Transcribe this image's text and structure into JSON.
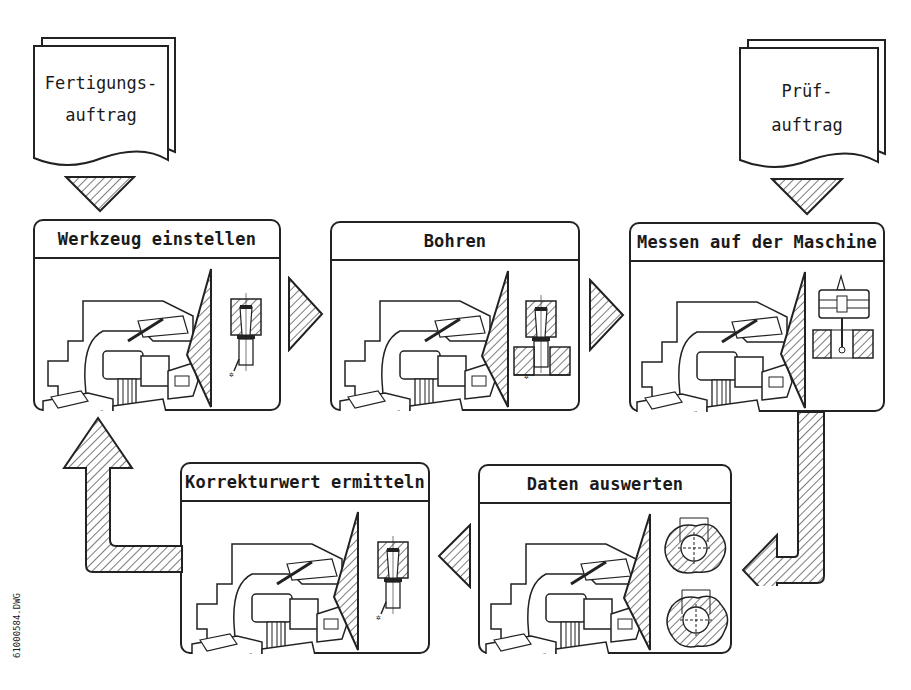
{
  "documents": [
    {
      "id": "fertigungsauftrag",
      "line1": "Fertigungs-",
      "line2": "auftrag"
    },
    {
      "id": "pruefauftrag",
      "line1": "Prüf-",
      "line2": "auftrag"
    }
  ],
  "steps": [
    {
      "id": "werkzeug",
      "title": "Werkzeug einstellen",
      "detail": "tool-holder"
    },
    {
      "id": "bohren",
      "title": "Bohren",
      "detail": "drilling-in-workpiece"
    },
    {
      "id": "messen",
      "title": "Messen auf der Maschine",
      "detail": "measuring-probe"
    },
    {
      "id": "daten",
      "title": "Daten auswerten",
      "detail": "bore-profiles"
    },
    {
      "id": "korrektur",
      "title": "Korrekturwert ermitteln",
      "detail": "tool-holder"
    }
  ],
  "flow": [
    "Werkzeug einstellen",
    "Bohren",
    "Messen auf der Maschine",
    "Daten auswerten",
    "Korrekturwert ermitteln",
    "Werkzeug einstellen"
  ],
  "drawing_code": "61000584.DWG",
  "colors": {
    "line": "#222222",
    "background": "#ffffff",
    "hatch": "#333333"
  }
}
